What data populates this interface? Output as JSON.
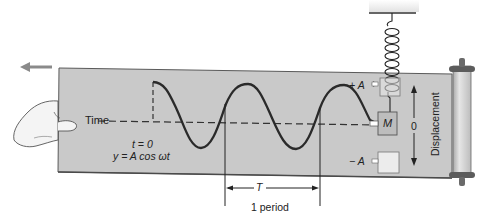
{
  "diagram": {
    "labels": {
      "time_axis": "Time",
      "t_zero": "t = 0",
      "equation": "y = A cos ωt",
      "plus_amplitude": "+ A",
      "minus_amplitude": "− A",
      "mass": "M",
      "zero": "0",
      "displacement": "Displacement",
      "period_symbol": "T",
      "period_label": "1 period"
    },
    "colors": {
      "paper": "#c9c9c9",
      "paper_edge": "#5a5a5a",
      "curve": "#2a2a2a",
      "arrow_motion": "#8a8a8a",
      "roller": "#d4d4d4",
      "roller_cap": "#5c5c5c",
      "mass_box": "#bdbdbd",
      "amplitude_box": "#e6e6e6",
      "ceiling": "#ececec"
    },
    "motion_direction": "left"
  }
}
